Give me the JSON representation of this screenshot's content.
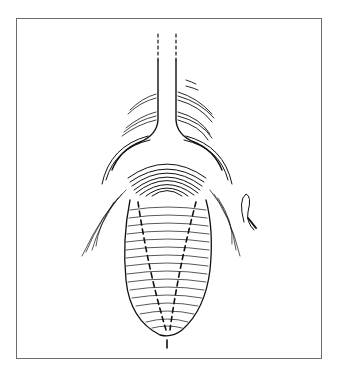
{
  "figure": {
    "type": "medical-line-illustration",
    "colors": {
      "background": "#ffffff",
      "frame": "#6b6b6b",
      "ink": "#111111"
    },
    "elements": [
      {
        "name": "tube-stalk",
        "style": "solid with dashed upper extension"
      },
      {
        "name": "flared-collar",
        "style": "curved contour lines"
      },
      {
        "name": "organ-body",
        "style": "hatched horizontal contours"
      },
      {
        "name": "incision-lines",
        "count": 2,
        "style": "dashed"
      },
      {
        "name": "surrounding-tissue",
        "style": "fine curved strokes"
      },
      {
        "name": "suture-loop",
        "style": "small loop at right"
      }
    ]
  }
}
